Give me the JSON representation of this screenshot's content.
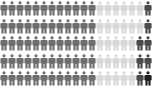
{
  "pictogram": {
    "rows": 5,
    "columns": 19,
    "icon": "person-icon",
    "colors": {
      "medium": "#6e6e6e",
      "light": "#d8d8d8",
      "dark": "#4a4a4a",
      "darkest": "#1e1e1e"
    },
    "grid": [
      [
        "medium",
        "medium",
        "medium",
        "medium",
        "medium",
        "medium",
        "medium",
        "medium",
        "medium",
        "medium",
        "medium",
        "medium",
        "light",
        "light",
        "light",
        "light",
        "light",
        "light",
        "dark"
      ],
      [
        "medium",
        "medium",
        "medium",
        "medium",
        "medium",
        "medium",
        "medium",
        "medium",
        "medium",
        "medium",
        "medium",
        "medium",
        "light",
        "light",
        "light",
        "light",
        "light",
        "light",
        "dark"
      ],
      [
        "medium",
        "medium",
        "medium",
        "medium",
        "medium",
        "medium",
        "medium",
        "medium",
        "medium",
        "medium",
        "medium",
        "medium",
        "light",
        "light",
        "light",
        "light",
        "light",
        "dark",
        "dark"
      ],
      [
        "medium",
        "medium",
        "medium",
        "medium",
        "medium",
        "medium",
        "medium",
        "medium",
        "medium",
        "medium",
        "medium",
        "medium",
        "light",
        "light",
        "light",
        "light",
        "light",
        "dark",
        "dark"
      ],
      [
        "medium",
        "medium",
        "medium",
        "medium",
        "medium",
        "medium",
        "medium",
        "medium",
        "medium",
        "medium",
        "medium",
        "medium",
        "light",
        "light",
        "light",
        "light",
        "light",
        "dark",
        "darkest"
      ]
    ]
  }
}
